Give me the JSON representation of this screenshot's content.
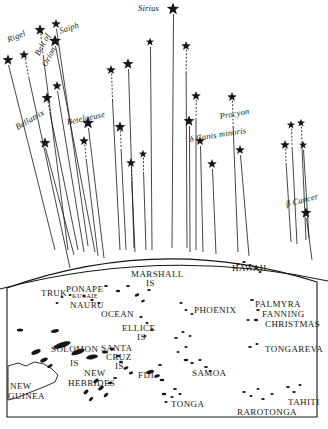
{
  "figure": {
    "kind": "star-compass-navigation-chart",
    "ink_color": "#161616",
    "background_color": "#ffffff"
  },
  "sky": {
    "star_labels": [
      {
        "text": "Sirius",
        "x": 138,
        "y": 4,
        "rot": 0
      },
      {
        "text": "Rigel",
        "x": 6,
        "y": 36,
        "rot": -22
      },
      {
        "text": "Saiph",
        "x": 58,
        "y": 27,
        "rot": -18
      },
      {
        "text": "Belt of",
        "x": 33,
        "y": 53,
        "rot": -62
      },
      {
        "text": "Orion",
        "x": 40,
        "y": 64,
        "rot": -62
      },
      {
        "text": "Bellatrix",
        "x": 14,
        "y": 124,
        "rot": -30
      },
      {
        "text": "Betelgeuse",
        "x": 66,
        "y": 118,
        "rot": -12
      },
      {
        "text": "Procyon",
        "x": 219,
        "y": 112,
        "rot": -10
      },
      {
        "text": "δ Canis minoris",
        "x": 189,
        "y": 135,
        "rot": -9
      },
      {
        "text": "β Cancer",
        "x": 285,
        "y": 200,
        "rot": -14
      }
    ],
    "stars": [
      {
        "x": 173,
        "y": 9,
        "s": 9
      },
      {
        "x": 8,
        "y": 60,
        "s": 8
      },
      {
        "x": 24,
        "y": 55,
        "s": 7
      },
      {
        "x": 40,
        "y": 30,
        "s": 8
      },
      {
        "x": 56,
        "y": 24,
        "s": 7
      },
      {
        "x": 55,
        "y": 41,
        "s": 9
      },
      {
        "x": 57,
        "y": 86,
        "s": 7
      },
      {
        "x": 47,
        "y": 98,
        "s": 8
      },
      {
        "x": 45,
        "y": 143,
        "s": 8
      },
      {
        "x": 88,
        "y": 123,
        "s": 9
      },
      {
        "x": 111,
        "y": 70,
        "s": 7
      },
      {
        "x": 128,
        "y": 64,
        "s": 8
      },
      {
        "x": 84,
        "y": 141,
        "s": 7
      },
      {
        "x": 120,
        "y": 127,
        "s": 8
      },
      {
        "x": 131,
        "y": 163,
        "s": 7
      },
      {
        "x": 150,
        "y": 42,
        "s": 6
      },
      {
        "x": 186,
        "y": 46,
        "s": 7
      },
      {
        "x": 196,
        "y": 96,
        "s": 7
      },
      {
        "x": 200,
        "y": 141,
        "s": 7
      },
      {
        "x": 212,
        "y": 164,
        "s": 7
      },
      {
        "x": 189,
        "y": 121,
        "s": 8
      },
      {
        "x": 232,
        "y": 97,
        "s": 7
      },
      {
        "x": 240,
        "y": 150,
        "s": 7
      },
      {
        "x": 291,
        "y": 125,
        "s": 6
      },
      {
        "x": 301,
        "y": 123,
        "s": 6
      },
      {
        "x": 285,
        "y": 145,
        "s": 7
      },
      {
        "x": 303,
        "y": 145,
        "s": 6
      },
      {
        "x": 306,
        "y": 213,
        "s": 8
      },
      {
        "x": 143,
        "y": 154,
        "s": 6
      }
    ],
    "paths": [
      {
        "x1": 8,
        "y1": 60,
        "x2": 55,
        "y2": 250
      },
      {
        "x1": 24,
        "y1": 55,
        "x2": 70,
        "y2": 268,
        "dash_top": 22
      },
      {
        "x1": 40,
        "y1": 30,
        "x2": 68,
        "y2": 250,
        "dash_top": 26
      },
      {
        "x1": 56,
        "y1": 24,
        "x2": 88,
        "y2": 246,
        "dash_top": 0
      },
      {
        "x1": 55,
        "y1": 41,
        "x2": 95,
        "y2": 252
      },
      {
        "x1": 47,
        "y1": 98,
        "x2": 78,
        "y2": 250,
        "dash_top": 16
      },
      {
        "x1": 57,
        "y1": 86,
        "x2": 84,
        "y2": 252
      },
      {
        "x1": 45,
        "y1": 143,
        "x2": 74,
        "y2": 255
      },
      {
        "x1": 88,
        "y1": 123,
        "x2": 104,
        "y2": 258
      },
      {
        "x1": 84,
        "y1": 141,
        "x2": 98,
        "y2": 256,
        "dash_top": 20
      },
      {
        "x1": 111,
        "y1": 70,
        "x2": 120,
        "y2": 250,
        "dash_top": 30
      },
      {
        "x1": 128,
        "y1": 64,
        "x2": 134,
        "y2": 248
      },
      {
        "x1": 120,
        "y1": 127,
        "x2": 126,
        "y2": 250,
        "dash_top": 22
      },
      {
        "x1": 131,
        "y1": 163,
        "x2": 135,
        "y2": 252,
        "dash_top": 18
      },
      {
        "x1": 150,
        "y1": 42,
        "x2": 152,
        "y2": 250
      },
      {
        "x1": 173,
        "y1": 9,
        "x2": 172,
        "y2": 248
      },
      {
        "x1": 186,
        "y1": 46,
        "x2": 187,
        "y2": 248,
        "dash_top": 26
      },
      {
        "x1": 196,
        "y1": 96,
        "x2": 196,
        "y2": 250,
        "dash_top": 22
      },
      {
        "x1": 189,
        "y1": 121,
        "x2": 190,
        "y2": 252
      },
      {
        "x1": 200,
        "y1": 141,
        "x2": 203,
        "y2": 252
      },
      {
        "x1": 212,
        "y1": 164,
        "x2": 216,
        "y2": 254
      },
      {
        "x1": 232,
        "y1": 97,
        "x2": 238,
        "y2": 252,
        "dash_top": 30
      },
      {
        "x1": 240,
        "y1": 150,
        "x2": 249,
        "y2": 256
      },
      {
        "x1": 291,
        "y1": 125,
        "x2": 297,
        "y2": 244,
        "dash_top": 22
      },
      {
        "x1": 301,
        "y1": 123,
        "x2": 306,
        "y2": 240,
        "dash_top": 22
      },
      {
        "x1": 285,
        "y1": 145,
        "x2": 291,
        "y2": 242,
        "dash_top": 18
      },
      {
        "x1": 303,
        "y1": 145,
        "x2": 309,
        "y2": 238
      },
      {
        "x1": 306,
        "y1": 213,
        "x2": 312,
        "y2": 260
      },
      {
        "x1": 143,
        "y1": 154,
        "x2": 146,
        "y2": 250,
        "dash_top": 18
      }
    ]
  },
  "map": {
    "frame": {
      "left_x": 7,
      "right_x": 317,
      "bottom_y": 417,
      "horizon_peak_y": 247,
      "horizon_edge_y": 288
    },
    "labels": [
      {
        "text": "MARSHALL",
        "x": 131,
        "y": 270,
        "size": "md"
      },
      {
        "text": "IS",
        "x": 146,
        "y": 279,
        "size": "md"
      },
      {
        "text": "TRUK",
        "x": 41,
        "y": 289,
        "size": "md"
      },
      {
        "text": "PONAPE",
        "x": 66,
        "y": 285,
        "size": "md"
      },
      {
        "text": "KUSAIE",
        "x": 72,
        "y": 293,
        "size": "xs"
      },
      {
        "text": "NAURU",
        "x": 70,
        "y": 301,
        "size": "md"
      },
      {
        "text": "OCEAN",
        "x": 101,
        "y": 310,
        "size": "md"
      },
      {
        "text": "ELLICE",
        "x": 122,
        "y": 324,
        "size": "md"
      },
      {
        "text": "IS",
        "x": 137,
        "y": 333,
        "size": "md"
      },
      {
        "text": "SOLOMON",
        "x": 51,
        "y": 345,
        "size": "md"
      },
      {
        "text": "IS",
        "x": 70,
        "y": 359,
        "size": "md"
      },
      {
        "text": "SANTA",
        "x": 101,
        "y": 344,
        "size": "md"
      },
      {
        "text": "CRUZ",
        "x": 106,
        "y": 353,
        "size": "md"
      },
      {
        "text": "IS",
        "x": 115,
        "y": 362,
        "size": "md"
      },
      {
        "text": "NEW",
        "x": 84,
        "y": 369,
        "size": "md"
      },
      {
        "text": "HEBRIDES",
        "x": 68,
        "y": 379,
        "size": "md"
      },
      {
        "text": "NEW",
        "x": 10,
        "y": 382,
        "size": "md"
      },
      {
        "text": "GUINEA",
        "x": 8,
        "y": 392,
        "size": "md"
      },
      {
        "text": "FIJI",
        "x": 138,
        "y": 371,
        "size": "md"
      },
      {
        "text": "HAWAII",
        "x": 232,
        "y": 264,
        "size": "md"
      },
      {
        "text": "PHOENIX",
        "x": 194,
        "y": 306,
        "size": "md"
      },
      {
        "text": "PALMYRA",
        "x": 255,
        "y": 300,
        "size": "md"
      },
      {
        "text": "FANNING",
        "x": 262,
        "y": 310,
        "size": "md"
      },
      {
        "text": "CHRISTMAS",
        "x": 265,
        "y": 320,
        "size": "md"
      },
      {
        "text": "TONGAREVA",
        "x": 265,
        "y": 345,
        "size": "md"
      },
      {
        "text": "SAMOA",
        "x": 192,
        "y": 369,
        "size": "md"
      },
      {
        "text": "TONGA",
        "x": 171,
        "y": 400,
        "size": "md"
      },
      {
        "text": "RAROTONGA",
        "x": 237,
        "y": 408,
        "size": "md"
      },
      {
        "text": "TAHITI",
        "x": 288,
        "y": 398,
        "size": "md"
      }
    ]
  }
}
